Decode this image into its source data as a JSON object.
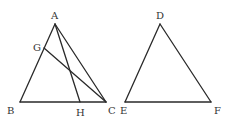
{
  "diagram": {
    "points": {
      "A": {
        "label": "A",
        "x": 55,
        "y": 24
      },
      "B": {
        "label": "B",
        "x": 20,
        "y": 102
      },
      "C": {
        "label": "C",
        "x": 106,
        "y": 102
      },
      "G": {
        "label": "G",
        "x": 44,
        "y": 48
      },
      "H": {
        "label": "H",
        "x": 80,
        "y": 102
      },
      "D": {
        "label": "D",
        "x": 160,
        "y": 24
      },
      "E": {
        "label": "E",
        "x": 125,
        "y": 102
      },
      "F": {
        "label": "F",
        "x": 211,
        "y": 102
      }
    },
    "segments": [
      [
        "A",
        "B"
      ],
      [
        "B",
        "C"
      ],
      [
        "A",
        "C"
      ],
      [
        "A",
        "H"
      ],
      [
        "G",
        "C"
      ],
      [
        "D",
        "E"
      ],
      [
        "E",
        "F"
      ],
      [
        "D",
        "F"
      ]
    ],
    "labels": {
      "A": "A",
      "B": "B",
      "C": "C",
      "G": "G",
      "H": "H",
      "D": "D",
      "E": "E",
      "F": "F"
    },
    "stroke_color": "#2a2a2a",
    "label_color": "#333333"
  }
}
